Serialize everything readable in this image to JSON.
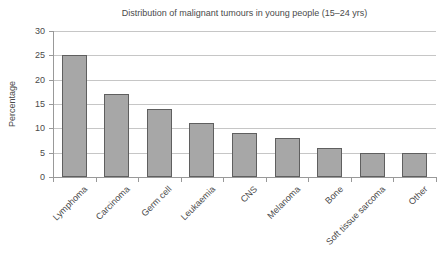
{
  "chart_data": {
    "type": "bar",
    "title": "Distribution of malignant tumours in young people (15–24 yrs)",
    "categories": [
      "Lymphoma",
      "Carcinoma",
      "Germ cell",
      "Leukaemia",
      "CNS",
      "Melanoma",
      "Bone",
      "Soft tissue sarcoma",
      "Other"
    ],
    "values": [
      25,
      17,
      14,
      11,
      9,
      8,
      6,
      5,
      5
    ],
    "xlabel": "",
    "ylabel": "Percentage",
    "ylim": [
      0,
      30
    ],
    "yticks": [
      0,
      5,
      10,
      15,
      20,
      25,
      30
    ],
    "grid": "horizontal",
    "legend": "none",
    "colors": {
      "bar_fill": "#a7a7a7",
      "bar_border": "#5f5f5f",
      "gridline": "#c6c6c6",
      "axis": "#999999",
      "text": "#4a4a4a",
      "background": "#ffffff"
    }
  }
}
